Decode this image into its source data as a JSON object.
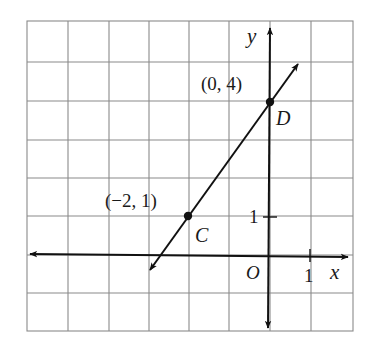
{
  "figure": {
    "type": "coordinate-plane-graph",
    "grid": {
      "columns": 8,
      "rows": 8,
      "x_range": [
        -6,
        2
      ],
      "y_range": [
        -2,
        6
      ],
      "unit": 1,
      "line_color": "#8a8a8a"
    },
    "axes": {
      "x_label": "x",
      "y_label": "y",
      "origin_label": "O",
      "x_tick_label": "1",
      "y_tick_label": "1",
      "color": "#111111"
    },
    "line": {
      "through": [
        "C",
        "D"
      ],
      "slope": "3/2",
      "y_intercept": 4,
      "color": "#111111"
    },
    "points": [
      {
        "name": "C",
        "coords_label": "(−2, 1)",
        "x": -2,
        "y": 1
      },
      {
        "name": "D",
        "coords_label": "(0, 4)",
        "x": 0,
        "y": 4
      }
    ]
  }
}
